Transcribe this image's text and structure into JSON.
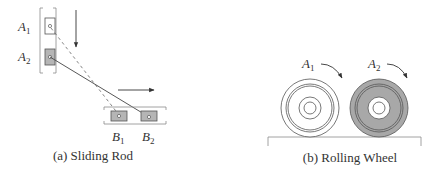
{
  "colors": {
    "stroke": "#555555",
    "light_stroke": "#999999",
    "slider_fill": "#b5b5b5",
    "wheel_fill": "#a8a8a8",
    "background": "#ffffff"
  },
  "panel_a": {
    "caption": "(a) Sliding Rod",
    "labels": {
      "a1": {
        "main": "A",
        "sub": "1"
      },
      "a2": {
        "main": "A",
        "sub": "2"
      },
      "b1": {
        "main": "B",
        "sub": "1"
      },
      "b2": {
        "main": "B",
        "sub": "2"
      }
    },
    "arrows": [
      "down-arrow",
      "right-arrow"
    ]
  },
  "panel_b": {
    "caption": "(b) Rolling Wheel",
    "labels": {
      "a1": {
        "main": "A",
        "sub": "1"
      },
      "a2": {
        "main": "A",
        "sub": "2"
      }
    },
    "arrows": [
      "clockwise-arrow",
      "clockwise-arrow"
    ]
  }
}
